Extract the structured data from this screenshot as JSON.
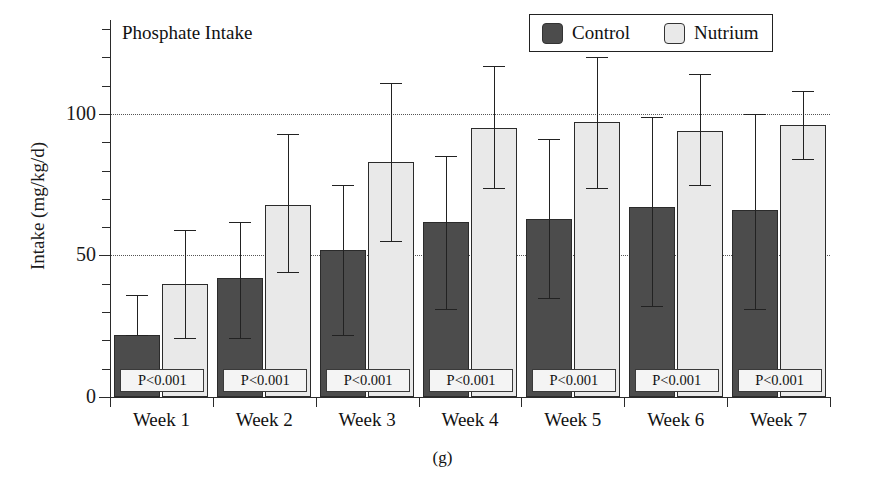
{
  "chart_data": {
    "type": "bar",
    "title": "Phosphate Intake",
    "xlabel": "",
    "ylabel": "Intake (mg/kg/d)",
    "ylim": [
      0,
      120
    ],
    "yticks": [
      0,
      50,
      100
    ],
    "ytick_labels": [
      "0",
      "50",
      "100"
    ],
    "minor_ticks": [
      10,
      20,
      30,
      40,
      60,
      70,
      80,
      90,
      110
    ],
    "grid": "horizontal dotted at 50 and 100",
    "legend_position": "top-right inside box",
    "categories": [
      "Week 1",
      "Week 2",
      "Week 3",
      "Week 4",
      "Week 5",
      "Week 6",
      "Week 7"
    ],
    "series": [
      {
        "name": "Control",
        "color": "#4c4c4c",
        "values": [
          22,
          42,
          52,
          62,
          63,
          67,
          66
        ],
        "err_upper": [
          36,
          62,
          75,
          85,
          91,
          99,
          100
        ],
        "err_lower": [
          22,
          21,
          22,
          31,
          35,
          32,
          31
        ]
      },
      {
        "name": "Nutrium",
        "color": "#e9e9e9",
        "values": [
          40,
          68,
          83,
          95,
          97,
          94,
          96
        ],
        "err_upper": [
          59,
          93,
          111,
          117,
          120,
          114,
          108
        ],
        "err_lower": [
          21,
          44,
          55,
          74,
          74,
          75,
          84
        ]
      }
    ],
    "annotations": [
      "P<0.001",
      "P<0.001",
      "P<0.001",
      "P<0.001",
      "P<0.001",
      "P<0.001",
      "P<0.001"
    ],
    "caption": "(g)"
  },
  "legend": {
    "items": [
      {
        "label": "Control",
        "color": "#4c4c4c"
      },
      {
        "label": "Nutrium",
        "color": "#e9e9e9"
      }
    ]
  },
  "axis": {
    "y_title": "Intake (mg/kg/d)",
    "tick_0": "0",
    "tick_50": "50",
    "tick_100": "100"
  },
  "title": "Phosphate Intake",
  "caption": "(g)"
}
